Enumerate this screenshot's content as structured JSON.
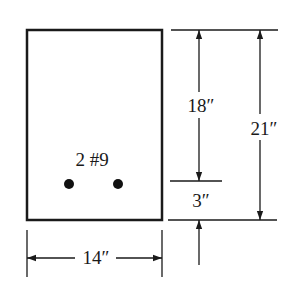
{
  "diagram": {
    "type": "beam-cross-section",
    "colors": {
      "stroke": "#1a1a1a",
      "background": "#ffffff"
    },
    "section": {
      "width_label": "14″",
      "rebar_label": "2 #9",
      "rebar_count": 2
    },
    "dimensions": {
      "effective_depth": "18″",
      "total_height": "21″",
      "cover": "3″",
      "width": "14″"
    }
  }
}
